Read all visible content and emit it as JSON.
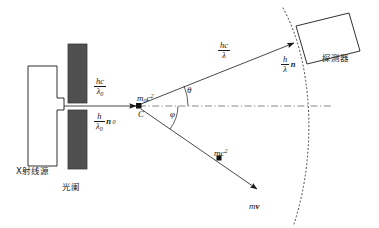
{
  "figure": {
    "domain_type": "physics-diagram",
    "description_title": "Compton scattering experimental setup",
    "background": "#ffffff",
    "line_color": "#1a1a1a",
    "fill_dark": "#4a4a4a"
  },
  "labels": {
    "source": "X射线源",
    "collimator": "光阑",
    "detector": "探测器",
    "vertex_point": "C",
    "angle_theta": "θ",
    "angle_phi": "φ"
  },
  "quantities": {
    "incident_energy": {
      "num": "hc",
      "den_base": "λ",
      "den_sub": "0"
    },
    "incident_momentum": {
      "num": "h",
      "den_base": "λ",
      "den_sub": "0",
      "vector": "n",
      "vector_sub": "0"
    },
    "scattered_energy": {
      "num": "hc",
      "den_base": "λ",
      "den_sub": ""
    },
    "scattered_momentum": {
      "num": "h",
      "den_base": "λ",
      "den_sub": "",
      "vector": "n",
      "vector_sub": ""
    },
    "rest_energy": {
      "base": "m",
      "sub": "0",
      "var": "c",
      "sup": "2"
    },
    "electron_energy": {
      "base": "m",
      "sub": "",
      "var": "c",
      "sup": "2"
    },
    "electron_momentum": {
      "base": "m",
      "vector": "v"
    }
  },
  "geometry": {
    "source_box": {
      "x": 28,
      "y": 66,
      "w": 29,
      "h": 100
    },
    "source_nub": {
      "x": 57,
      "y": 98,
      "w": 7,
      "h": 12
    },
    "collimator_top": {
      "x": 68,
      "y": 44,
      "w": 19,
      "h": 59
    },
    "collimator_bottom": {
      "x": 68,
      "y": 110,
      "w": 19,
      "h": 59
    },
    "beam_axis_y": 106,
    "vertex": {
      "x": 139,
      "y": 106
    },
    "photon_out_end": {
      "x": 296,
      "y": 42
    },
    "electron_out_end": {
      "x": 258,
      "y": 190
    },
    "electron_dot": {
      "x": 219,
      "y": 158
    },
    "detector_corners": "295,25 348,12 360,50 307,63",
    "arc": "M 283,8 Q 320,112 294,224"
  }
}
